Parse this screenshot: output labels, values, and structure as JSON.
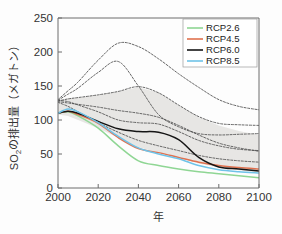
{
  "chart_data": {
    "type": "line",
    "title": "",
    "xlabel": "年",
    "ylabel": "SO₂の排出量（メガトン）",
    "xlim": [
      2000,
      2100
    ],
    "ylim": [
      0,
      250
    ],
    "xticks": [
      "2000",
      "2020",
      "2040",
      "2060",
      "2080",
      "2100"
    ],
    "xtick_values": [
      2000,
      2020,
      2040,
      2060,
      2080,
      2100
    ],
    "yticks": [
      "0",
      "50",
      "100",
      "150",
      "200",
      "250"
    ],
    "ytick_values": [
      0,
      50,
      100,
      150,
      200,
      250
    ],
    "grid": false,
    "legend_position": "top-right",
    "x": [
      2000,
      2005,
      2010,
      2020,
      2030,
      2040,
      2050,
      2060,
      2070,
      2080,
      2090,
      2100
    ],
    "series": [
      {
        "name": "RCP2.6",
        "color": "#8fd694",
        "style": "solid",
        "values": [
          110,
          112,
          106,
          88,
          62,
          40,
          33,
          28,
          24,
          21,
          18,
          15
        ]
      },
      {
        "name": "RCP4.5",
        "color": "#e0714f",
        "style": "solid",
        "values": [
          110,
          113,
          108,
          95,
          74,
          58,
          52,
          45,
          38,
          33,
          30,
          28
        ]
      },
      {
        "name": "RCP6.0",
        "color": "#151515",
        "style": "solid",
        "values": [
          110,
          113,
          110,
          98,
          87,
          83,
          82,
          71,
          45,
          31,
          28,
          25
        ]
      },
      {
        "name": "RCP8.5",
        "color": "#6fc3e8",
        "style": "solid",
        "values": [
          110,
          116,
          112,
          96,
          76,
          59,
          50,
          43,
          33,
          27,
          24,
          22
        ]
      }
    ],
    "range_band": {
      "label": "scenario range",
      "color": "#e3e2df",
      "upper": [
        128,
        132,
        133,
        137,
        142,
        148,
        140,
        122,
        104,
        92,
        84,
        78
      ],
      "lower": [
        108,
        106,
        100,
        88,
        74,
        60,
        52,
        44,
        36,
        30,
        26,
        22
      ]
    },
    "dashed_scenarios": [
      {
        "name": "dashed-upper-peak",
        "values": [
          130,
          143,
          156,
          188,
          213,
          208,
          190,
          168,
          148,
          130,
          120,
          115
        ]
      },
      {
        "name": "dashed-mid-high",
        "values": [
          129,
          138,
          147,
          170,
          186,
          150,
          108,
          90,
          80,
          78,
          79,
          80
        ]
      },
      {
        "name": "dashed-band-upper",
        "values": [
          128,
          131,
          133,
          137,
          142,
          149,
          140,
          122,
          105,
          95,
          93,
          92
        ]
      },
      {
        "name": "dashed-slow-decline",
        "values": [
          127,
          125,
          123,
          119,
          114,
          110,
          104,
          92,
          78,
          66,
          59,
          54
        ]
      },
      {
        "name": "dashed-steep-decline",
        "values": [
          129,
          127,
          122,
          112,
          100,
          96,
          94,
          83,
          70,
          62,
          57,
          55
        ]
      },
      {
        "name": "dashed-lower",
        "values": [
          126,
          120,
          112,
          96,
          82,
          70,
          62,
          55,
          48,
          43,
          40,
          38
        ]
      }
    ]
  },
  "legend": {
    "items": [
      {
        "label": "RCP2.6",
        "color": "#8fd694"
      },
      {
        "label": "RCP4.5",
        "color": "#e0714f"
      },
      {
        "label": "RCP6.0",
        "color": "#151515"
      },
      {
        "label": "RCP8.5",
        "color": "#6fc3e8"
      }
    ]
  },
  "axes": {
    "x_label": "年",
    "y_label_parts": {
      "so": "SO",
      "sub": "2",
      "rest": "の排出量（メガトン）"
    }
  }
}
